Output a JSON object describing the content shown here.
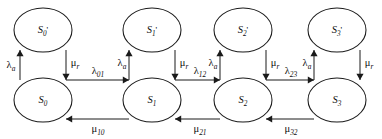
{
  "diagram": {
    "type": "state-transition-diagram",
    "title": "",
    "geometry": {
      "width": 382,
      "height": 139,
      "columns_x": [
        43,
        152,
        243,
        337
      ],
      "top_row_cy": 30,
      "bottom_row_cy": 100,
      "ellipse_rx": 29,
      "ellipse_ry": 22
    },
    "colors": {
      "stroke": "#1a1a1a",
      "background": "#ffffff",
      "text": "#0d0d0d"
    },
    "top_nodes": [
      {
        "id": "S0p",
        "base": "S",
        "sub": "0",
        "prime": "'",
        "cx": 43,
        "cy": 30
      },
      {
        "id": "S1p",
        "base": "S",
        "sub": "1",
        "prime": "'",
        "cx": 152,
        "cy": 30
      },
      {
        "id": "S2p",
        "base": "S",
        "sub": "2",
        "prime": "'",
        "cx": 243,
        "cy": 30
      },
      {
        "id": "S3p",
        "base": "S",
        "sub": "3",
        "prime": "'",
        "cx": 337,
        "cy": 30
      }
    ],
    "bottom_nodes": [
      {
        "id": "S0",
        "base": "S",
        "sub": "0",
        "prime": "",
        "cx": 43,
        "cy": 100
      },
      {
        "id": "S1",
        "base": "S",
        "sub": "1",
        "prime": "",
        "cx": 152,
        "cy": 100
      },
      {
        "id": "S2",
        "base": "S",
        "sub": "2",
        "prime": "",
        "cx": 243,
        "cy": 100
      },
      {
        "id": "S3",
        "base": "S",
        "sub": "3",
        "prime": "",
        "cx": 337,
        "cy": 100
      }
    ],
    "vertical_edges": [
      {
        "id": "v0-up",
        "from": "S0",
        "to": "S0p",
        "direction": "up",
        "x": 20,
        "base": "λ",
        "sub": "a",
        "label_x": 11,
        "label_y": 66
      },
      {
        "id": "v0-down",
        "from": "S0p",
        "to": "S0",
        "direction": "down",
        "x": 66,
        "base": "μ",
        "sub": "r",
        "label_x": 75,
        "label_y": 64
      },
      {
        "id": "v1-up",
        "from": "S1",
        "to": "S1p",
        "direction": "up",
        "x": 129,
        "base": "λ",
        "sub": "a",
        "label_x": 122,
        "label_y": 64
      },
      {
        "id": "v1-down",
        "from": "S1p",
        "to": "S1",
        "direction": "down",
        "x": 175,
        "base": "μ",
        "sub": "r",
        "label_x": 184,
        "label_y": 64
      },
      {
        "id": "v2-up",
        "from": "S2",
        "to": "S2p",
        "direction": "up",
        "x": 220,
        "base": "λ",
        "sub": "a",
        "label_x": 213,
        "label_y": 64
      },
      {
        "id": "v2-down",
        "from": "S2p",
        "to": "S2",
        "direction": "down",
        "x": 266,
        "base": "μ",
        "sub": "r",
        "label_x": 275,
        "label_y": 64
      },
      {
        "id": "v3-up",
        "from": "S3",
        "to": "S3p",
        "direction": "up",
        "x": 314,
        "base": "λ",
        "sub": "a",
        "label_x": 307,
        "label_y": 64
      },
      {
        "id": "v3-down",
        "from": "S3p",
        "to": "S3",
        "direction": "down",
        "x": 360,
        "base": "μ",
        "sub": "r",
        "label_x": 369,
        "label_y": 64
      }
    ],
    "forward_edges": [
      {
        "id": "f01",
        "from": "S0",
        "to": "S1",
        "base": "λ",
        "sub": "01",
        "x1": 66,
        "x2": 129,
        "y": 80,
        "label_x": 98,
        "label_y": 72
      },
      {
        "id": "f12",
        "from": "S1",
        "to": "S2",
        "base": "λ",
        "sub": "12",
        "x1": 175,
        "x2": 220,
        "y": 80,
        "label_x": 200,
        "label_y": 72
      },
      {
        "id": "f23",
        "from": "S2",
        "to": "S3",
        "base": "λ",
        "sub": "23",
        "x1": 266,
        "x2": 314,
        "y": 80,
        "label_x": 291,
        "label_y": 72
      }
    ],
    "backward_edges": [
      {
        "id": "b10",
        "from": "S1",
        "to": "S0",
        "base": "μ",
        "sub": "10",
        "x1": 129,
        "x2": 66,
        "y": 119,
        "label_x": 98,
        "label_y": 130
      },
      {
        "id": "b21",
        "from": "S2",
        "to": "S1",
        "base": "μ",
        "sub": "21",
        "x1": 220,
        "x2": 175,
        "y": 119,
        "label_x": 200,
        "label_y": 130
      },
      {
        "id": "b32",
        "from": "S3",
        "to": "S2",
        "base": "μ",
        "sub": "32",
        "x1": 314,
        "x2": 266,
        "y": 119,
        "label_x": 291,
        "label_y": 130
      }
    ]
  }
}
